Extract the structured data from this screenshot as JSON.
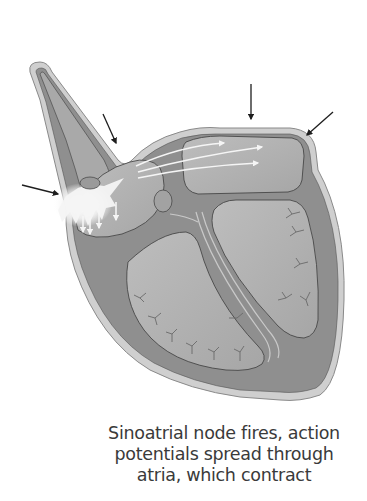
{
  "diagram": {
    "stage": "sinoatrial-node-firing",
    "colors": {
      "background": "#ffffff",
      "muscle_wall": "#8c8c8c",
      "outer_rim": "#cfcfcf",
      "chamber_fill": "#b3b3b3",
      "outline": "#3c3c3c",
      "impulse_glow": "#f2f2f2",
      "arrow_black": "#1e1e1e",
      "arrow_white": "#f5f5f5"
    },
    "pointer_arrows": [
      {
        "name": "left-atrium-pointer",
        "from": [
          22,
          185
        ],
        "to": [
          60,
          194
        ]
      },
      {
        "name": "vena-cava-pointer",
        "from": [
          103,
          115
        ],
        "to": [
          116,
          144
        ]
      },
      {
        "name": "top-atrium-pointer",
        "from": [
          251,
          85
        ],
        "to": [
          251,
          118
        ]
      },
      {
        "name": "right-atrium-pointer",
        "from": [
          333,
          112
        ],
        "to": [
          306,
          136
        ]
      }
    ],
    "impulse_arrows_count": 4,
    "spread_arrows_count": 3
  },
  "caption": {
    "line1": "Sinoatrial node fires, action",
    "line2": "potentials spread through",
    "line3": "atria, which contract"
  }
}
